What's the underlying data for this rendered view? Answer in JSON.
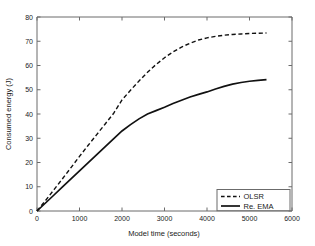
{
  "chart_data": {
    "type": "line",
    "title": "",
    "xlabel": "Model time (seconds)",
    "ylabel": "Consumed energy (J)",
    "xlim": [
      0,
      6000
    ],
    "ylim": [
      0,
      80
    ],
    "xticks": [
      0,
      1000,
      2000,
      3000,
      4000,
      5000,
      6000
    ],
    "xtick_labels": [
      "0",
      "1000",
      "2000",
      "3000",
      "4000",
      "5000",
      "6000"
    ],
    "yticks": [
      0,
      10,
      20,
      30,
      40,
      50,
      60,
      70,
      80
    ],
    "ytick_labels": [
      "0",
      "10",
      "20",
      "30",
      "40",
      "50",
      "60",
      "70",
      "80"
    ],
    "grid": false,
    "legend_position": "lower right",
    "series": [
      {
        "name": "OLSR",
        "style": "dashed",
        "color": "#111111",
        "x": [
          0,
          200,
          400,
          600,
          800,
          1000,
          1200,
          1400,
          1600,
          1800,
          2000,
          2200,
          2400,
          2600,
          2800,
          3000,
          3200,
          3400,
          3600,
          3800,
          4000,
          4200,
          4400,
          4600,
          4800,
          5000,
          5200,
          5400
        ],
        "y": [
          0,
          4.3,
          8.8,
          13.3,
          17.9,
          22.5,
          27.0,
          31.4,
          35.8,
          40.2,
          45.8,
          49.8,
          53.6,
          57.2,
          60.4,
          63.2,
          65.6,
          67.6,
          69.2,
          70.5,
          71.4,
          72.0,
          72.5,
          72.8,
          73.0,
          73.2,
          73.3,
          73.4
        ]
      },
      {
        "name": "Re. EMA",
        "style": "solid",
        "color": "#111111",
        "x": [
          0,
          200,
          400,
          600,
          800,
          1000,
          1200,
          1400,
          1600,
          1800,
          2000,
          2200,
          2400,
          2600,
          2800,
          3000,
          3200,
          3400,
          3600,
          3800,
          4000,
          4200,
          4400,
          4600,
          4800,
          5000,
          5200,
          5400
        ],
        "y": [
          0,
          3.3,
          6.6,
          9.9,
          13.2,
          16.5,
          19.8,
          23.1,
          26.4,
          29.7,
          33.0,
          35.6,
          38.0,
          40.0,
          41.4,
          42.8,
          44.3,
          45.7,
          47.0,
          48.1,
          49.1,
          50.3,
          51.4,
          52.3,
          53.0,
          53.5,
          53.9,
          54.2
        ]
      }
    ]
  },
  "legend": {
    "entries": [
      {
        "label": "OLSR",
        "style": "dashed"
      },
      {
        "label": "Re. EMA",
        "style": "solid"
      }
    ]
  },
  "axes": {
    "x_title": "Model time (seconds)",
    "y_title": "Consumed energy (J)"
  }
}
